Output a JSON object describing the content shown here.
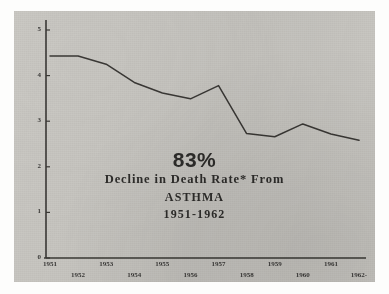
{
  "chart_data": {
    "type": "line",
    "title": "83% Decline in Death Rate* From ASTHMA 1951-1962",
    "xlabel": "",
    "ylabel": "",
    "categories": [
      "1951",
      "1952",
      "1953",
      "1954",
      "1955",
      "1956",
      "1957",
      "1958",
      "1959",
      "1960",
      "1961",
      "1962"
    ],
    "values": [
      4.43,
      4.43,
      4.25,
      3.85,
      3.62,
      3.49,
      3.78,
      2.73,
      2.66,
      2.94,
      2.72,
      2.58
    ],
    "series": [
      {
        "name": "Asthma death rate",
        "values": [
          4.43,
          4.43,
          4.25,
          3.85,
          3.62,
          3.49,
          3.78,
          2.73,
          2.66,
          2.94,
          2.72,
          2.58
        ]
      }
    ],
    "ylim": [
      0,
      5
    ],
    "yticks": [
      0,
      1,
      2,
      3,
      4,
      5
    ],
    "ytick_labels": [
      "0",
      "1",
      "2",
      "3",
      "4",
      "5"
    ],
    "xtick_labels_upper": [
      "1951",
      "1953",
      "1955",
      "1957",
      "1959",
      "1961"
    ],
    "xtick_labels_lower": [
      "1952",
      "1954",
      "1956",
      "1958",
      "1960",
      "1962-"
    ],
    "grid": false,
    "legend": null,
    "line_color": "#3a3835",
    "background_color": "#c9c7c2"
  },
  "caption": {
    "percent": "83%",
    "line1": "Decline in Death Rate* From",
    "line2": "ASTHMA",
    "line3": "1951-1962"
  },
  "colors": {
    "card": "#c9c7c2",
    "ink": "#3a3835",
    "page": "#fdfdfc"
  }
}
